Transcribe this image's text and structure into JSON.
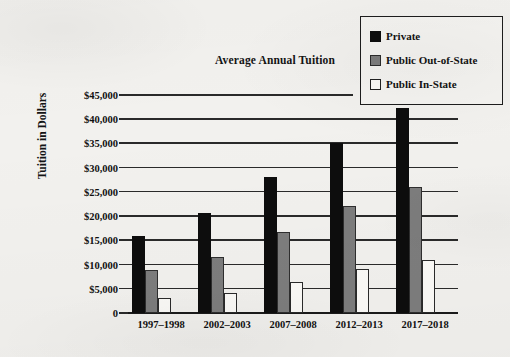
{
  "chart_data": {
    "type": "bar",
    "title": "Average Annual Tuition",
    "xlabel": "",
    "ylabel": "Tuition in Dollars",
    "ylim": [
      0,
      45000
    ],
    "ytick_step": 5000,
    "grid": true,
    "legend_position": "top-right",
    "categories": [
      "1997–1998",
      "2002–2003",
      "2007–2008",
      "2012–2013",
      "2017–2018"
    ],
    "ytick_labels": [
      "$45,000",
      "$40,000",
      "$35,000",
      "$30,000",
      "$25,000",
      "$20,000",
      "$15,000",
      "$10,000",
      "$5,000",
      "0"
    ],
    "ytick_values": [
      45000,
      40000,
      35000,
      30000,
      25000,
      20000,
      15000,
      10000,
      5000,
      0
    ],
    "series": [
      {
        "name": "Private",
        "color": "#0d0d0d",
        "swatch": "sw-private",
        "values": [
          16000,
          20700,
          28000,
          35000,
          42300
        ]
      },
      {
        "name": "Public Out-of-State",
        "color": "#7d7d7d",
        "swatch": "sw-out-of-state",
        "values": [
          8800,
          11600,
          16700,
          22000,
          26000
        ]
      },
      {
        "name": "Public In-State",
        "color": "#fbfaf7",
        "swatch": "sw-in-state",
        "values": [
          3000,
          4100,
          6400,
          9000,
          10900
        ]
      }
    ]
  }
}
